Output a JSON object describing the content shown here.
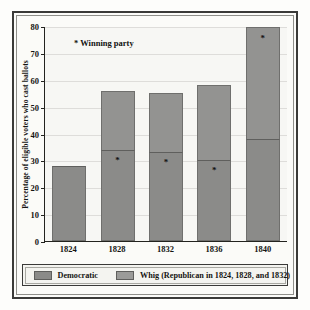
{
  "chart_data": {
    "type": "bar",
    "title": "",
    "xlabel": "",
    "ylabel": "Percentage of eligible voters who cast ballots",
    "ylim": [
      0,
      80
    ],
    "yticks": [
      0,
      10,
      20,
      30,
      40,
      50,
      60,
      70,
      80
    ],
    "grid": true,
    "stacked": true,
    "categories": [
      "1824",
      "1828",
      "1832",
      "1836",
      "1840"
    ],
    "series": [
      {
        "name": "Democratic",
        "values": [
          28,
          34,
          33,
          30,
          38
        ]
      },
      {
        "name": "Whig (Republican in 1824, 1828, and 1832)",
        "values": [
          0,
          22,
          22,
          28,
          42
        ]
      }
    ],
    "totals": [
      28,
      56,
      55,
      58,
      80
    ],
    "winner_marks": [
      {
        "category": "1824",
        "series": null
      },
      {
        "category": "1828",
        "series": "Democratic"
      },
      {
        "category": "1832",
        "series": "Democratic"
      },
      {
        "category": "1836",
        "series": "Democratic"
      },
      {
        "category": "1840",
        "series": "Whig (Republican in 1824, 1828, and 1832)"
      }
    ],
    "annotations": [
      {
        "text": "* Winning party"
      }
    ],
    "legend_position": "bottom",
    "colors": {
      "democratic": "#8b8b89",
      "whig": "#939391",
      "grid": "#dedddA",
      "axis": "#23231f",
      "plot_background": "#f7f7f4",
      "frame": "#3a3a38"
    }
  },
  "axis": {
    "y_title": "Percentage of eligible voters who cast ballots",
    "y_ticks": [
      "80",
      "70",
      "60",
      "50",
      "40",
      "30",
      "20",
      "10",
      "0"
    ],
    "x_ticks": [
      "1824",
      "1828",
      "1832",
      "1836",
      "1840"
    ]
  },
  "annotation": {
    "winning_party": "* Winning party",
    "star_glyph": "*"
  },
  "legend": {
    "items": [
      {
        "label": "Democratic",
        "swatch": "democratic-swatch"
      },
      {
        "label": "Whig (Republican in 1824, 1828, and 1832)",
        "swatch": "whig-swatch"
      }
    ]
  }
}
